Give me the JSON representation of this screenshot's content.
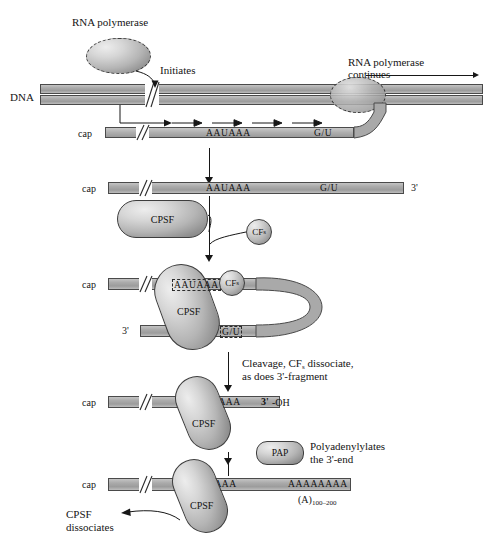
{
  "figure": {
    "labels": {
      "rna_polymerase": "RNA polymerase",
      "initiates": "Initiates",
      "rna_polymerase_continues_line1": "RNA polymerase",
      "rna_polymerase_continues_line2": "continues",
      "dna": "DNA",
      "cap": "cap",
      "three_prime": "3'",
      "three_prime_oh": "-OH",
      "cleavage_line1": "Cleavage, CF",
      "cleavage_line1_sub": "s",
      "cleavage_line1_tail": " dissociate,",
      "cleavage_line2": "as does 3'-fragment",
      "polyadenylylates_line1": "Polyadenylylates",
      "polyadenylylates_line2": "the 3'-end",
      "cpsf_dissociates_line1": "CPSF",
      "cpsf_dissociates_line2": "dissociates",
      "polyA_length_base": "(A)",
      "polyA_length_sub": "100–200"
    },
    "proteins": {
      "cpsf": "CPSF",
      "cfs_base": "CF",
      "cfs_sub": "s",
      "pap": "PAP",
      "polymerase_blob": ""
    },
    "sequences": {
      "aauaaa": "AAUAAA",
      "gu": "G/U",
      "polyA": "AAAAAAAA"
    },
    "colors": {
      "strand_fill": "#ababab",
      "strand_border": "#4a4a4a",
      "protein_fill": "#b5b5b5",
      "protein_border": "#3d3d3d",
      "ink": "#141414",
      "background": "#ffffff"
    },
    "steps": [
      {
        "id": "step-1-transcription",
        "caption": "RNA polymerase initiates and continues along DNA; nascent RNA with cap, AAUAAA and G/U elements"
      },
      {
        "id": "step-2-cpsf-binding",
        "caption": "Free pre-mRNA with cap, AAUAAA, G/U and 3' end; CPSF and CFs approach"
      },
      {
        "id": "step-3-loop-complex",
        "caption": "CPSF and CFs bridge AAUAAA and G/U forming a loop"
      },
      {
        "id": "step-4-cleavage",
        "caption": "Cleaved RNA with 3'-OH, CPSF bound at AAUAAA"
      },
      {
        "id": "step-5-polyadenylation",
        "caption": "PAP polyadenylylates the 3'-end; CPSF dissociates"
      }
    ]
  }
}
